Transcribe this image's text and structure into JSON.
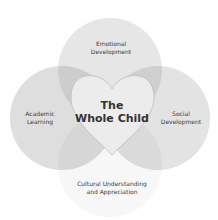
{
  "diagram": {
    "type": "venn-with-center-heart",
    "center": {
      "line1": "The",
      "line2": "Whole Child"
    },
    "circles": [
      {
        "id": "emotional",
        "line1": "Emotional",
        "line2": "Development",
        "color": "#e6e6e6"
      },
      {
        "id": "academic",
        "line1": "Academic",
        "line2": "Learning",
        "color": "#dedede"
      },
      {
        "id": "social",
        "line1": "Social",
        "line2": "Development",
        "color": "#e3e3e3"
      },
      {
        "id": "cultural",
        "line1": "Cultural Understanding",
        "line2": "and Appreciation",
        "color": "#f7f7f7"
      }
    ],
    "overlap_color": "#c9c9c9",
    "heart_color": "#ececec",
    "heart_stroke": "#bdbdbd"
  }
}
